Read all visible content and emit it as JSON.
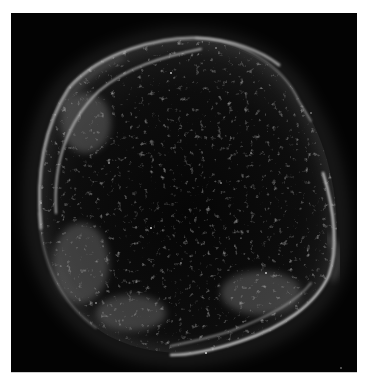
{
  "image": {
    "subject": "supernova remnant shell",
    "background_color": "#030303",
    "border_color": "#ffffff",
    "filament_color": "#e6e6e6",
    "speckle_color": "#bdbdbd"
  }
}
